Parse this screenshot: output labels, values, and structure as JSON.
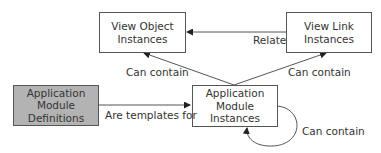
{
  "nodes": {
    "view_object": {
      "label_line1": "View Object",
      "label_line2": "Instances"
    },
    "view_link": {
      "label_line1": "View Link",
      "label_line2": "Instances"
    },
    "am_definitions": {
      "label_line1": "Application",
      "label_line2": "Module",
      "label_line3": "Definitions"
    },
    "am_instances": {
      "label_line1": "Application",
      "label_line2": "Module",
      "label_line3": "Instances"
    }
  },
  "edges": {
    "relate": "Relate",
    "am_contains_vo": "Can contain",
    "am_contains_vl": "Can contain",
    "templates": "Are templates for",
    "am_contains_am": "Can contain"
  },
  "colors": {
    "definition_fill": "#b3b3b3",
    "stroke": "#555555"
  }
}
